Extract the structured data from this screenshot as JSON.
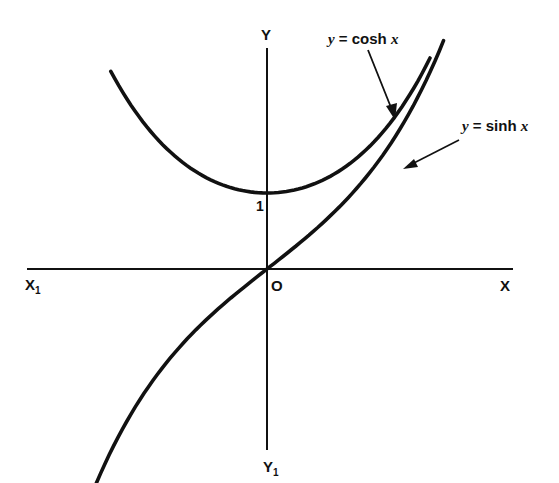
{
  "chart_data": {
    "type": "line",
    "title": "",
    "xlabel": "X",
    "ylabel": "Y",
    "axis_labels": {
      "x_positive": "X",
      "x_negative": "X₁",
      "y_positive": "Y",
      "y_negative": "Y₁",
      "origin": "O",
      "y_tick": "1"
    },
    "grid": false,
    "legend": "none (annotations with arrows)",
    "series": [
      {
        "name": "y = cosh x",
        "function": "cosh",
        "x_range": [
          -1.61,
          1.68
        ],
        "points": [
          {
            "x": -1.6,
            "y": 2.58
          },
          {
            "x": -1.2,
            "y": 1.81
          },
          {
            "x": -0.8,
            "y": 1.34
          },
          {
            "x": -0.4,
            "y": 1.08
          },
          {
            "x": 0,
            "y": 1.0
          },
          {
            "x": 0.4,
            "y": 1.08
          },
          {
            "x": 0.8,
            "y": 1.34
          },
          {
            "x": 1.2,
            "y": 1.81
          },
          {
            "x": 1.6,
            "y": 2.58
          }
        ]
      },
      {
        "name": "y = sinh x",
        "function": "sinh",
        "x_range": [
          -1.76,
          1.82
        ],
        "points": [
          {
            "x": -1.6,
            "y": -2.38
          },
          {
            "x": -1.2,
            "y": -1.51
          },
          {
            "x": -0.8,
            "y": -0.89
          },
          {
            "x": -0.4,
            "y": -0.41
          },
          {
            "x": 0,
            "y": 0
          },
          {
            "x": 0.4,
            "y": 0.41
          },
          {
            "x": 0.8,
            "y": 0.89
          },
          {
            "x": 1.2,
            "y": 1.51
          },
          {
            "x": 1.6,
            "y": 2.38
          }
        ]
      }
    ],
    "annotations": [
      {
        "text": "y = cosh x",
        "points_to": "cosh curve, upper right"
      },
      {
        "text": "y = sinh x",
        "points_to": "sinh curve, upper right"
      }
    ]
  },
  "labels": {
    "y_axis": "Y",
    "y_axis_neg": "Y",
    "y_axis_neg_sub": "1",
    "x_axis": "X",
    "x_axis_neg": "X",
    "x_axis_neg_sub": "1",
    "origin": "O",
    "tick_one": "1",
    "cosh_eq_y": "y",
    "cosh_eq_mid": " = cosh ",
    "cosh_eq_x": "x",
    "sinh_eq_y": "y",
    "sinh_eq_mid": " = sinh ",
    "sinh_eq_x": "x"
  },
  "style": {
    "ink": "#111111",
    "background": "#ffffff"
  }
}
